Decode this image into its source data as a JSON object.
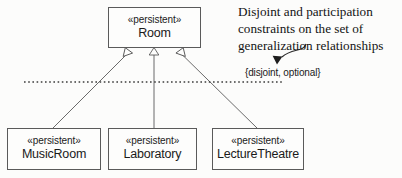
{
  "diagram": {
    "type": "uml-class-diagram",
    "title_annotation": {
      "lines": [
        "Disjoint and participation",
        "constraints on the set of",
        "generalization relationships"
      ],
      "line1": "Disjoint and participation",
      "line2": "constraints on the set of",
      "line3": "generalization relationships"
    },
    "constraint_label": "{disjoint, optional}",
    "superclass": {
      "stereotype": "«persistent»",
      "name": "Room"
    },
    "subclasses": [
      {
        "stereotype": "«persistent»",
        "name": "MusicRoom"
      },
      {
        "stereotype": "«persistent»",
        "name": "Laboratory"
      },
      {
        "stereotype": "«persistent»",
        "name": "LectureTheatre"
      }
    ],
    "relationship_kind": "generalization",
    "colors": {
      "background": "#fcfcfb",
      "box_border": "#5a5a5a",
      "box_fill": "#fdfdfc",
      "line": "#5a5a5a",
      "text": "#1a1a1a",
      "annotation_text": "#131313"
    }
  }
}
